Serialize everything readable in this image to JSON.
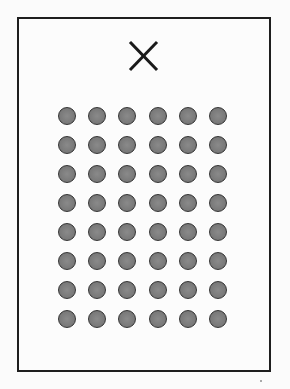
{
  "figure": {
    "mark": {
      "icon": "x-mark-icon",
      "label": "X"
    },
    "grid": {
      "rows": 8,
      "columns": 6
    },
    "colors": {
      "frame": "#1e1e1e",
      "dot_fill": "#7a7a7a",
      "dot_border": "#333333",
      "background": "#fbfbfb"
    }
  }
}
